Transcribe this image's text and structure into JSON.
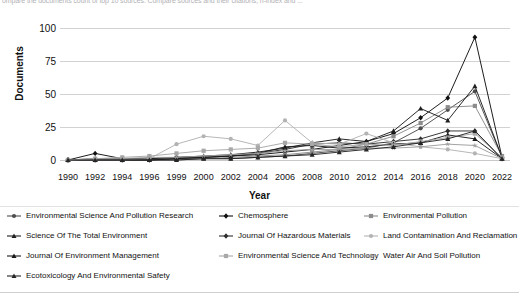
{
  "figure": {
    "clipped_caption": "ompare the documents count of top 10 sources. Compare sources and their citations, h-index and ..."
  },
  "chart_data": {
    "type": "line",
    "title": "",
    "xlabel": "Year",
    "ylabel": "Documents",
    "ylim": [
      0,
      100
    ],
    "yticks": [
      0,
      25,
      50,
      75,
      100
    ],
    "grid": true,
    "legend_position": "bottom",
    "categories": [
      "1990",
      "1992",
      "1994",
      "1996",
      "1999",
      "2000",
      "2002",
      "2004",
      "2006",
      "2008",
      "2010",
      "2012",
      "2014",
      "2016",
      "2018",
      "2020",
      "2022"
    ],
    "series": [
      {
        "name": "Environmental Science And Pollution Research",
        "color": "#4d4d4d",
        "marker": "circle",
        "values": [
          0,
          0,
          0,
          0,
          0,
          1,
          1,
          2,
          3,
          5,
          7,
          9,
          13,
          24,
          38,
          52,
          2
        ]
      },
      {
        "name": "Chemosphere",
        "color": "#111111",
        "marker": "diamond",
        "values": [
          0,
          5,
          1,
          1,
          2,
          2,
          3,
          4,
          6,
          8,
          11,
          14,
          20,
          32,
          47,
          93,
          2
        ]
      },
      {
        "name": "Environmental Pollution",
        "color": "#8c8c8c",
        "marker": "square",
        "values": [
          0,
          0,
          0,
          1,
          1,
          1,
          2,
          3,
          4,
          6,
          8,
          12,
          18,
          28,
          40,
          41,
          3
        ]
      },
      {
        "name": "Science Of The Total Environment",
        "color": "#1f1f1f",
        "marker": "triangle",
        "values": [
          0,
          1,
          1,
          1,
          2,
          3,
          4,
          6,
          9,
          13,
          16,
          14,
          22,
          39,
          30,
          56,
          2
        ]
      },
      {
        "name": "Journal Of Hazardous Materials",
        "color": "#2e2e2e",
        "marker": "diamond",
        "values": [
          0,
          0,
          0,
          0,
          1,
          2,
          3,
          5,
          8,
          12,
          13,
          12,
          14,
          16,
          22,
          22,
          1
        ]
      },
      {
        "name": "Land Contamination And Reclamation",
        "color": "#b3b3b3",
        "marker": "circle",
        "values": [
          0,
          0,
          0,
          1,
          12,
          18,
          16,
          11,
          30,
          13,
          12,
          20,
          13,
          10,
          8,
          5,
          1
        ]
      },
      {
        "name": "Journal Of Environment Management",
        "color": "#1a1a1a",
        "marker": "triangle",
        "values": [
          0,
          0,
          0,
          0,
          1,
          2,
          3,
          5,
          10,
          11,
          9,
          10,
          12,
          13,
          19,
          16,
          1
        ]
      },
      {
        "name": "Environmental Science And Technology",
        "color": "#a8a8a8",
        "marker": "square",
        "values": [
          0,
          1,
          2,
          3,
          5,
          7,
          8,
          9,
          13,
          12,
          10,
          12,
          11,
          14,
          17,
          20,
          2
        ]
      },
      {
        "name": "Water Air And Soil Pollution",
        "color": "#9e9e9e",
        "marker": "star",
        "values": [
          0,
          1,
          1,
          2,
          2,
          3,
          4,
          5,
          7,
          8,
          8,
          9,
          9,
          10,
          12,
          11,
          1
        ]
      },
      {
        "name": "Ecotoxicology And Environmental Safety",
        "color": "#262626",
        "marker": "triangle",
        "values": [
          0,
          0,
          0,
          0,
          0,
          1,
          1,
          2,
          3,
          4,
          6,
          8,
          10,
          13,
          16,
          22,
          1
        ]
      }
    ]
  }
}
